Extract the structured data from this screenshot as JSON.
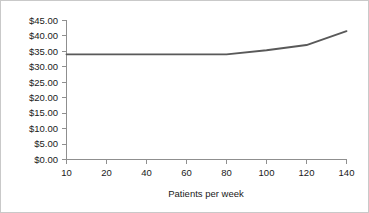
{
  "chart_data": {
    "type": "line",
    "title": "",
    "subtitle": "",
    "xlabel": "Patients per week",
    "ylabel": "",
    "categories": [
      "10",
      "20",
      "40",
      "60",
      "80",
      "100",
      "120",
      "140"
    ],
    "x": [
      10,
      20,
      40,
      60,
      80,
      100,
      120,
      140
    ],
    "values": [
      34.0,
      34.0,
      34.0,
      34.0,
      34.0,
      35.3,
      37.0,
      41.5
    ],
    "series": [
      {
        "name": "Cost per patient",
        "values": [
          34.0,
          34.0,
          34.0,
          34.0,
          34.0,
          35.3,
          37.0,
          41.5
        ],
        "color": "#595959"
      }
    ],
    "ylim": [
      0,
      45
    ],
    "ytick_values": [
      0,
      5,
      10,
      15,
      20,
      25,
      30,
      35,
      40,
      45
    ],
    "ytick_labels": [
      "$0.00",
      "$5.00",
      "$10.00",
      "$15.00",
      "$20.00",
      "$25.00",
      "$30.00",
      "$35.00",
      "$40.00",
      "$45.00"
    ],
    "xtick_labels": [
      "10",
      "20",
      "40",
      "60",
      "80",
      "100",
      "120",
      "140"
    ],
    "grid": false,
    "legend": false,
    "legend_position": "none",
    "x_axis_scale": "categorical",
    "annotations": []
  },
  "figure": {
    "background_color": "#ffffff",
    "border_color": "#c9c9c9",
    "axis_color": "#8f8f8f",
    "text_color": "#1a1a1a",
    "series_color": "#595959"
  }
}
